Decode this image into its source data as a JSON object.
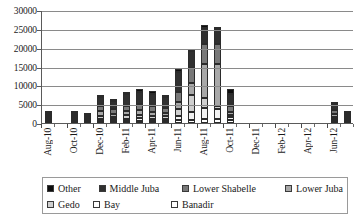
{
  "chart_data": {
    "type": "bar",
    "stacked": true,
    "title": "",
    "subtitle": "",
    "xlabel": "",
    "ylabel": "",
    "ylim": [
      0,
      30000
    ],
    "ytick_labels": [
      "0",
      "5000",
      "10000",
      "15000",
      "20000",
      "25000",
      "30000"
    ],
    "ytick_values": [
      0,
      5000,
      10000,
      15000,
      20000,
      25000,
      30000
    ],
    "grid": true,
    "legend_position": "bottom",
    "categories": [
      "Aug-10",
      "Sep-10",
      "Oct-10",
      "Nov-10",
      "Dec-10",
      "Jan-11",
      "Feb-11",
      "Mar-11",
      "Apr-11",
      "May-11",
      "Jun-11",
      "Jul-11",
      "Aug-11",
      "Sep-11",
      "Oct-11",
      "Nov-11",
      "Dec-11",
      "Jan-12",
      "Feb-12",
      "Mar-12",
      "Apr-12",
      "May-12",
      "Jun-12",
      "Jul-12"
    ],
    "xtick_labels": [
      "Aug-10",
      "Oct-10",
      "Dec-10",
      "Feb-11",
      "Apr-11",
      "Jun-11",
      "Aug-11",
      "Oct-11",
      "Dec-11",
      "Feb-12",
      "Apr-12",
      "Jun-12"
    ],
    "xtick_label_indices": [
      0,
      2,
      4,
      6,
      8,
      10,
      12,
      14,
      16,
      18,
      20,
      22
    ],
    "series": [
      {
        "name": "Banadir",
        "color": "#ffffff",
        "values": [
          0,
          0,
          0,
          0,
          400,
          300,
          350,
          400,
          350,
          300,
          700,
          850,
          1100,
          1000,
          800,
          0,
          0,
          0,
          0,
          0,
          0,
          0,
          500,
          0
        ]
      },
      {
        "name": "Bay",
        "color": "#f2f2f2",
        "values": [
          30,
          0,
          40,
          0,
          500,
          400,
          600,
          700,
          600,
          550,
          1100,
          2200,
          3000,
          2800,
          700,
          0,
          0,
          0,
          0,
          0,
          0,
          0,
          350,
          100
        ]
      },
      {
        "name": "Gedo",
        "color": "#cfcfcf",
        "values": [
          20,
          0,
          30,
          150,
          700,
          500,
          900,
          900,
          800,
          700,
          1800,
          4400,
          2600,
          800,
          500,
          0,
          0,
          0,
          0,
          0,
          0,
          0,
          500,
          120
        ]
      },
      {
        "name": "Lower Juba",
        "color": "#a8a8a8",
        "values": [
          20,
          0,
          30,
          100,
          1300,
          900,
          1100,
          1300,
          1100,
          900,
          2000,
          3300,
          9000,
          11000,
          900,
          0,
          0,
          0,
          0,
          0,
          0,
          0,
          700,
          100
        ]
      },
      {
        "name": "Lower Shabelle",
        "color": "#787878",
        "values": [
          30,
          0,
          40,
          150,
          1500,
          1200,
          1500,
          1700,
          1600,
          1400,
          2700,
          3900,
          5200,
          5500,
          1500,
          0,
          0,
          0,
          0,
          0,
          0,
          0,
          1200,
          180
        ]
      },
      {
        "name": "Middle Juba",
        "color": "#303030",
        "values": [
          40,
          0,
          50,
          200,
          2300,
          2200,
          3000,
          3200,
          3000,
          2800,
          5300,
          4500,
          4400,
          4000,
          3400,
          0,
          0,
          0,
          0,
          0,
          0,
          0,
          1500,
          300
        ]
      },
      {
        "name": "Other",
        "color": "#0d0d0d",
        "values": [
          20,
          0,
          20,
          60,
          700,
          400,
          700,
          700,
          800,
          700,
          800,
          50,
          800,
          300,
          1200,
          0,
          0,
          0,
          0,
          0,
          0,
          0,
          150,
          50
        ]
      }
    ],
    "totals": [
      160,
      0,
      210,
      660,
      7400,
      5900,
      8150,
      8900,
      8250,
      7350,
      14400,
      19200,
      26100,
      25400,
      9000,
      0,
      0,
      0,
      0,
      0,
      0,
      0,
      4900,
      850
    ]
  },
  "legend": {
    "items": [
      {
        "label": "Other",
        "color": "#0d0d0d"
      },
      {
        "label": "Middle Juba",
        "color": "#303030"
      },
      {
        "label": "Lower Shabelle",
        "color": "#787878"
      },
      {
        "label": "Lower Juba",
        "color": "#a8a8a8"
      },
      {
        "label": "Gedo",
        "color": "#cfcfcf"
      },
      {
        "label": "Bay",
        "color": "#ffffff"
      },
      {
        "label": "Banadir",
        "color": "#ffffff"
      }
    ],
    "row_split": 4
  }
}
